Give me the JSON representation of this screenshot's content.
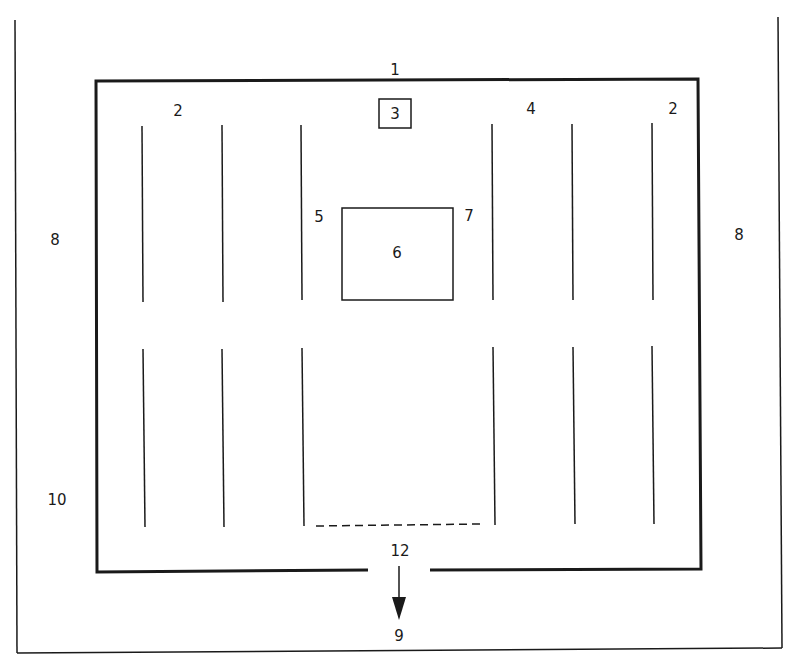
{
  "diagram": {
    "type": "floor-plan",
    "colors": {
      "line": "#1a1a1a",
      "background": "#ffffff"
    },
    "labels": [
      {
        "id": "1",
        "text": "1",
        "x": 395,
        "y": 75
      },
      {
        "id": "2a",
        "text": "2",
        "x": 178,
        "y": 116
      },
      {
        "id": "3",
        "text": "3",
        "x": 395,
        "y": 118
      },
      {
        "id": "4",
        "text": "4",
        "x": 531,
        "y": 114
      },
      {
        "id": "2b",
        "text": "2",
        "x": 673,
        "y": 114
      },
      {
        "id": "5",
        "text": "5",
        "x": 319,
        "y": 222
      },
      {
        "id": "7",
        "text": "7",
        "x": 469,
        "y": 221
      },
      {
        "id": "6",
        "text": "6",
        "x": 397,
        "y": 258
      },
      {
        "id": "8a",
        "text": "8",
        "x": 55,
        "y": 245
      },
      {
        "id": "8b",
        "text": "8",
        "x": 739,
        "y": 240
      },
      {
        "id": "10",
        "text": "10",
        "x": 57,
        "y": 505
      },
      {
        "id": "12",
        "text": "12",
        "x": 400,
        "y": 556
      },
      {
        "id": "9",
        "text": "9",
        "x": 399,
        "y": 641
      }
    ]
  }
}
